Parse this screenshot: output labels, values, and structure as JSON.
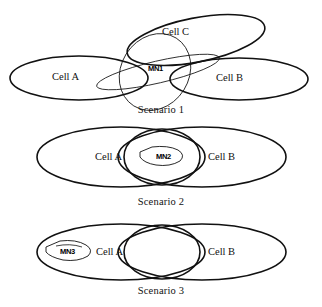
{
  "figure": {
    "stroke_color": "#111111",
    "background": "#ffffff"
  },
  "scenarios": [
    {
      "caption": "Scenario 1",
      "cells": [
        {
          "label": "Cell A"
        },
        {
          "label": "Cell B"
        },
        {
          "label": "Cell C"
        }
      ],
      "mobile_node": {
        "label": "MN1"
      }
    },
    {
      "caption": "Scenario 2",
      "cells": [
        {
          "label": "Cell A"
        },
        {
          "label": "Cell B"
        }
      ],
      "mobile_node": {
        "label": "MN2"
      }
    },
    {
      "caption": "Scenario 3",
      "cells": [
        {
          "label": "Cell A"
        },
        {
          "label": "Cell B"
        }
      ],
      "mobile_node": {
        "label": "MN3"
      }
    }
  ]
}
